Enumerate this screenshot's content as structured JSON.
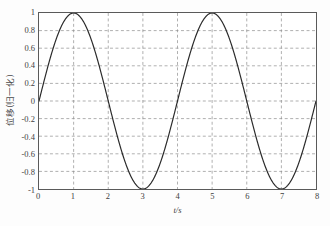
{
  "chart_data": {
    "type": "line",
    "title": "",
    "subtitle": "",
    "xlabel": "t/s",
    "ylabel": "位移(归一化)",
    "xlim": [
      0,
      8
    ],
    "ylim": [
      -1,
      1
    ],
    "xticks": [
      0,
      1,
      2,
      3,
      4,
      5,
      6,
      7,
      8
    ],
    "xtick_labels": [
      "0",
      "1",
      "2",
      "3",
      "4",
      "5",
      "6",
      "7",
      "8"
    ],
    "yticks": [
      -1,
      -0.8,
      -0.6,
      -0.4,
      -0.2,
      0,
      0.2,
      0.4,
      0.6,
      0.8,
      1
    ],
    "ytick_labels": [
      "-1",
      "-0.8",
      "-0.6",
      "-0.4",
      "-0.2",
      "0",
      "0.2",
      "0.4",
      "0.6",
      "0.8",
      "1"
    ],
    "grid": true,
    "grid_style": "dashed",
    "grid_color": "#8c8c8c",
    "legend": null,
    "legend_position": "none",
    "annotations": [],
    "series": [
      {
        "name": "位移",
        "color": "#2b2b2b",
        "line_width": 1.2,
        "formula": "y = sin(pi*t/2)",
        "amplitude": 1,
        "period": 4,
        "phase": 0,
        "x": [
          0,
          0.1,
          0.2,
          0.3,
          0.4,
          0.5,
          0.6,
          0.7,
          0.8,
          0.9,
          1,
          1.1,
          1.2,
          1.3,
          1.4,
          1.5,
          1.6,
          1.7,
          1.8,
          1.9,
          2,
          2.1,
          2.2,
          2.3,
          2.4,
          2.5,
          2.6,
          2.7,
          2.8,
          2.9,
          3,
          3.1,
          3.2,
          3.3,
          3.4,
          3.5,
          3.6,
          3.7,
          3.8,
          3.9,
          4,
          4.1,
          4.2,
          4.3,
          4.4,
          4.5,
          4.6,
          4.7,
          4.8,
          4.9,
          5,
          5.1,
          5.2,
          5.3,
          5.4,
          5.5,
          5.6,
          5.7,
          5.8,
          5.9,
          6,
          6.1,
          6.2,
          6.3,
          6.4,
          6.5,
          6.6,
          6.7,
          6.8,
          6.9,
          7,
          7.1,
          7.2,
          7.3,
          7.4,
          7.5,
          7.6,
          7.7,
          7.8,
          7.9,
          8
        ],
        "values": [
          0,
          0.156,
          0.309,
          0.454,
          0.588,
          0.707,
          0.809,
          0.891,
          0.951,
          0.988,
          1,
          0.988,
          0.951,
          0.891,
          0.809,
          0.707,
          0.588,
          0.454,
          0.309,
          0.156,
          0,
          -0.156,
          -0.309,
          -0.454,
          -0.588,
          -0.707,
          -0.809,
          -0.891,
          -0.951,
          -0.988,
          -1,
          -0.988,
          -0.951,
          -0.891,
          -0.809,
          -0.707,
          -0.588,
          -0.454,
          -0.309,
          -0.156,
          0,
          0.156,
          0.309,
          0.454,
          0.588,
          0.707,
          0.809,
          0.891,
          0.951,
          0.988,
          1,
          0.988,
          0.951,
          0.891,
          0.809,
          0.707,
          0.588,
          0.454,
          0.309,
          0.156,
          0,
          -0.156,
          -0.309,
          -0.454,
          -0.588,
          -0.707,
          -0.809,
          -0.891,
          -0.951,
          -0.988,
          -1,
          -0.988,
          -0.951,
          -0.891,
          -0.809,
          -0.707,
          -0.588,
          -0.454,
          -0.309,
          -0.156,
          0
        ],
        "peaks": [
          {
            "x": 1,
            "y": 1
          },
          {
            "x": 5,
            "y": 1
          }
        ],
        "troughs": [
          {
            "x": 3,
            "y": -1
          },
          {
            "x": 7,
            "y": -1
          }
        ],
        "zero_crossings": [
          0,
          2,
          4,
          6,
          8
        ]
      }
    ]
  },
  "figure": {
    "background_color": "#fdfdfd",
    "plot_background_color": "#ffffff",
    "axis_color": "#5a5a5a"
  }
}
